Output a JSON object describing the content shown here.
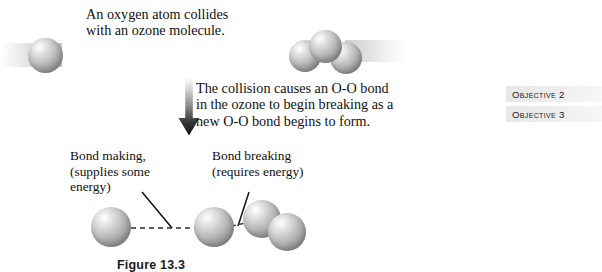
{
  "figure": {
    "caption": "Figure 13.3",
    "background_color": "#ffffff",
    "sphere_color": "#a8a8a8"
  },
  "annotations": {
    "intro": "An oxygen atom collides\nwith an ozone molecule.",
    "collision": "The collision causes an O-O bond\nin the ozone to begin breaking as a\nnew O-O bond begins to form.",
    "bond_making": "Bond making,\n(supplies some\nenergy)",
    "bond_breaking": "Bond breaking\n(requires energy)"
  },
  "objectives": {
    "items": [
      {
        "label": "Objective 2"
      },
      {
        "label": "Objective 3"
      }
    ],
    "badge_color": "#eeeeee"
  },
  "icons": {
    "arrow": "down-arrow-icon"
  },
  "molecules": {
    "top": {
      "free_atom": "oxygen-atom",
      "cluster": "ozone-molecule",
      "cluster_atom_count": 3
    },
    "bottom": {
      "free_atom": "oxygen-atom",
      "center_atom": "oxygen-atom",
      "cluster": "oxygen-molecule",
      "cluster_atom_count": 2,
      "forming_bond": "dashed-bond-forming",
      "breaking_bond": "dashed-bond-breaking"
    }
  }
}
